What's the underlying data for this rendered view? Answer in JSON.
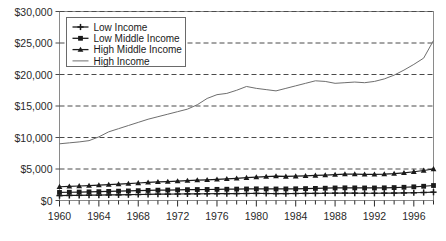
{
  "chart_data": {
    "type": "line",
    "title": "",
    "xlabel": "",
    "ylabel": "",
    "ylim": [
      0,
      30000
    ],
    "xlim": [
      1960,
      1998
    ],
    "grid": true,
    "grid_style": "dashed-horizontal",
    "legend_position": "upper-left-inside",
    "ytick_labels": [
      "$0",
      "$5,000",
      "$10,000",
      "$15,000",
      "$20,000",
      "$25,000",
      "$30,000"
    ],
    "ytick_values": [
      0,
      5000,
      10000,
      15000,
      20000,
      25000,
      30000
    ],
    "xtick_labels": [
      "1960",
      "1964",
      "1968",
      "1972",
      "1976",
      "1980",
      "1984",
      "1988",
      "1992",
      "1996"
    ],
    "xtick_values": [
      1960,
      1964,
      1968,
      1972,
      1976,
      1980,
      1984,
      1988,
      1992,
      1996
    ],
    "x": [
      1960,
      1961,
      1962,
      1963,
      1964,
      1965,
      1966,
      1967,
      1968,
      1969,
      1970,
      1971,
      1972,
      1973,
      1974,
      1975,
      1976,
      1977,
      1978,
      1979,
      1980,
      1981,
      1982,
      1983,
      1984,
      1985,
      1986,
      1987,
      1988,
      1989,
      1990,
      1991,
      1992,
      1993,
      1994,
      1995,
      1996,
      1997,
      1998
    ],
    "series": [
      {
        "name": "Low Income",
        "marker": "plus",
        "color": "#1a1a1a",
        "values": [
          780,
          800,
          820,
          840,
          860,
          880,
          900,
          920,
          950,
          980,
          1000,
          1010,
          1030,
          1050,
          1060,
          1070,
          1080,
          1090,
          1100,
          1110,
          1120,
          1110,
          1100,
          1100,
          1110,
          1120,
          1130,
          1150,
          1160,
          1170,
          1160,
          1150,
          1150,
          1160,
          1180,
          1200,
          1230,
          1270,
          1320
        ]
      },
      {
        "name": "Low Middle Income",
        "marker": "square",
        "color": "#1a1a1a",
        "values": [
          1280,
          1310,
          1340,
          1370,
          1400,
          1440,
          1480,
          1520,
          1560,
          1600,
          1640,
          1660,
          1690,
          1720,
          1740,
          1750,
          1770,
          1790,
          1810,
          1830,
          1850,
          1840,
          1830,
          1840,
          1860,
          1890,
          1920,
          1950,
          1990,
          2010,
          2000,
          1990,
          1990,
          2010,
          2050,
          2100,
          2170,
          2260,
          2380
        ]
      },
      {
        "name": "High Middle Income",
        "marker": "triangle",
        "color": "#1a1a1a",
        "values": [
          2180,
          2240,
          2300,
          2370,
          2440,
          2520,
          2600,
          2690,
          2780,
          2880,
          2960,
          3010,
          3080,
          3160,
          3230,
          3280,
          3350,
          3430,
          3520,
          3620,
          3720,
          3800,
          3880,
          3820,
          3860,
          3920,
          3980,
          4040,
          4120,
          4200,
          4180,
          4150,
          4160,
          4200,
          4280,
          4400,
          4560,
          4760,
          5000
        ]
      },
      {
        "name": "High Income",
        "marker": "none",
        "color": "#6e6e6e",
        "values": [
          9000,
          9150,
          9300,
          9500,
          10100,
          10900,
          11400,
          11900,
          12400,
          12900,
          13300,
          13700,
          14100,
          14500,
          15200,
          16200,
          16800,
          17000,
          17500,
          18100,
          17800,
          17600,
          17400,
          17800,
          18200,
          18600,
          19000,
          18900,
          18600,
          18700,
          18800,
          18700,
          18900,
          19300,
          19900,
          20700,
          21600,
          22600,
          25400
        ]
      }
    ]
  },
  "axis": {
    "y_min_label": "$0",
    "y_max_label": "$30,000"
  }
}
